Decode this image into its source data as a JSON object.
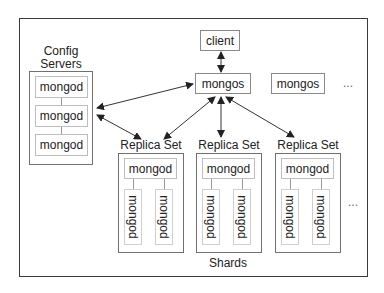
{
  "diagram": {
    "config": {
      "title_line1": "Config",
      "title_line2": "Servers",
      "nodes": [
        "mongod",
        "mongod",
        "mongod"
      ]
    },
    "client": {
      "label": "client"
    },
    "routers": [
      {
        "label": "mongos"
      },
      {
        "label": "mongos"
      }
    ],
    "routers_more": "...",
    "replica_sets": [
      {
        "title": "Replica Set",
        "primary": "mongod",
        "secondaries": [
          "mongod",
          "mongod"
        ]
      },
      {
        "title": "Replica Set",
        "primary": "mongod",
        "secondaries": [
          "mongod",
          "mongod"
        ]
      },
      {
        "title": "Replica Set",
        "primary": "mongod",
        "secondaries": [
          "mongod",
          "mongod"
        ]
      }
    ],
    "shards_more": "...",
    "shards_label": "Shards",
    "colors": {
      "frame": "#3a3a3a",
      "group_border": "#707070",
      "node_border": "#bdbdbd",
      "arrow": "#222222"
    }
  }
}
